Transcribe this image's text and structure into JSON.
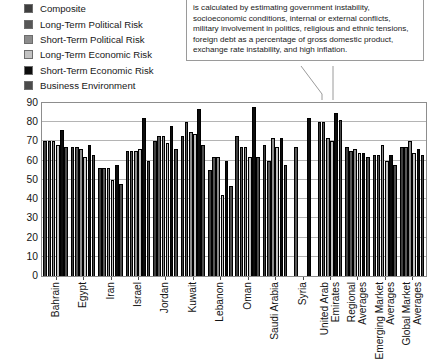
{
  "callout": {
    "text": "is calculated by estimating government instability, socioeconomic conditions, internal or external conflicts, military involvement in politics, religious and ethnic tensions, foreign debt as a percentage of gross domestic product, exchange rate instability, and high inflation."
  },
  "legend": {
    "items": [
      {
        "label": "Composite",
        "color": "#3f3f3f"
      },
      {
        "label": "Long-Term Political Risk",
        "color": "#575757"
      },
      {
        "label": "Short-Term Political Risk",
        "color": "#8c8c8c"
      },
      {
        "label": "Long-Term Economic Risk",
        "color": "#c2c2c2"
      },
      {
        "label": "Short-Term Economic Risk",
        "color": "#0d0d0d"
      },
      {
        "label": "Business Environment",
        "color": "#4b4b4b"
      }
    ]
  },
  "chart_data": {
    "type": "bar",
    "title": "",
    "xlabel": "",
    "ylabel": "",
    "ylim": [
      0,
      90
    ],
    "yticks": [
      0,
      10,
      20,
      30,
      40,
      50,
      60,
      70,
      80,
      90
    ],
    "grid": true,
    "legend_position": "top-left",
    "categories": [
      "Bahrain",
      "Egypt",
      "Iran",
      "Israel",
      "Jordan",
      "Kuwait",
      "Lebanon",
      "Oman",
      "Saudi Arabia",
      "Syria",
      "United Arab Emirates",
      "Regional Averages",
      "Emerging Market Averages",
      "Global Market Averages"
    ],
    "categories_wrapped": [
      [
        "Bahrain"
      ],
      [
        "Egypt"
      ],
      [
        "Iran"
      ],
      [
        "Israel"
      ],
      [
        "Jordan"
      ],
      [
        "Kuwait"
      ],
      [
        "Lebanon"
      ],
      [
        "Oman"
      ],
      [
        "Saudi Arabia"
      ],
      [
        "Syria"
      ],
      [
        "United Arab",
        "Emirates"
      ],
      [
        "Regional",
        "Averages"
      ],
      [
        "Emerging Market",
        "Averages"
      ],
      [
        "Global Market",
        "Averages"
      ]
    ],
    "series": [
      {
        "name": "Composite",
        "color": "#3f3f3f",
        "values": [
          70,
          67,
          56,
          65,
          70,
          73,
          55,
          73,
          68,
          null,
          80,
          67,
          63,
          67
        ]
      },
      {
        "name": "Long-Term Political Risk",
        "color": "#575757",
        "values": [
          70,
          67,
          56,
          65,
          73,
          80,
          62,
          67,
          60,
          67,
          80,
          65,
          63,
          67
        ]
      },
      {
        "name": "Short-Term Political Risk",
        "color": "#8c8c8c",
        "values": [
          70,
          66,
          56,
          65,
          73,
          75,
          62,
          67,
          72,
          null,
          72,
          66,
          68,
          70
        ]
      },
      {
        "name": "Long-Term Economic Risk",
        "color": "#c2c2c2",
        "values": [
          68,
          62,
          50,
          66,
          69,
          74,
          42,
          62,
          67,
          null,
          70,
          64,
          60,
          64
        ]
      },
      {
        "name": "Short-Term Economic Risk",
        "color": "#0d0d0d",
        "values": [
          76,
          68,
          58,
          82,
          78,
          87,
          60,
          88,
          72,
          82,
          85,
          64,
          63,
          66
        ]
      },
      {
        "name": "Business Environment",
        "color": "#4b4b4b",
        "values": [
          67,
          63,
          48,
          60,
          66,
          68,
          47,
          62,
          58,
          null,
          81,
          62,
          58,
          63
        ]
      }
    ]
  }
}
